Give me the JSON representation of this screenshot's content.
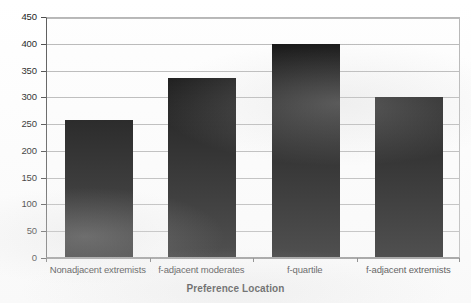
{
  "chart_data": {
    "type": "bar",
    "title": "",
    "xlabel": "Preference Location",
    "ylabel": "",
    "categories": [
      "Nonadjacent extremists",
      "f-adjacent moderates",
      "f-quartile",
      "f-adjacent extremists"
    ],
    "values": [
      255,
      335,
      397,
      298
    ],
    "ylim": [
      0,
      450
    ],
    "ytick_values": [
      0,
      50,
      100,
      150,
      200,
      250,
      300,
      350,
      400,
      450
    ],
    "ytick_labels": [
      "0",
      "50",
      "100",
      "150",
      "200",
      "250",
      "300",
      "350",
      "400",
      "450"
    ],
    "grid": true,
    "grid_axis": "y",
    "legend": false,
    "legend_position": "none",
    "bar_color": "#0d0d0d",
    "gridline_color": "#b9b9b9",
    "axis_color": "#5b5b5b",
    "plot_background": "#fefefe"
  },
  "axis_titles": {
    "x": "Preference Location"
  }
}
